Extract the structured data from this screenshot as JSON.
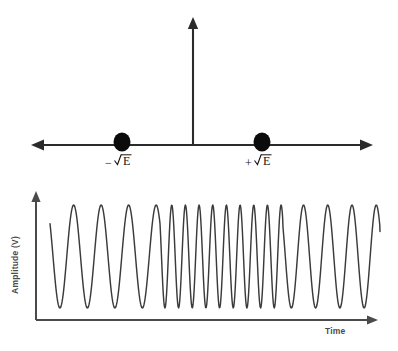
{
  "figure": {
    "title_visible": false,
    "background_color": "#ffffff",
    "stroke_color": "#3b3b3b",
    "axis_color": "#2b2b2b",
    "dot_color": "#0b0b0b"
  },
  "constellation": {
    "name": "bfsk-signal-space-diagram",
    "horizontal_axis": {
      "name": "horizontal-axis",
      "x_start": 32,
      "x_end": 372,
      "y": 145,
      "double_headed": true
    },
    "vertical_axis": {
      "name": "vertical-axis",
      "x": 193,
      "y_top": 18,
      "y_bottom": 145,
      "double_headed": false
    },
    "points": [
      {
        "name": "constellation-point-negative",
        "label_sign": "−",
        "label_radicand": "E",
        "label_text": "−√E",
        "cx": 122,
        "cy": 142,
        "rx": 8.5,
        "ry": 9.5,
        "label_x": 108,
        "label_y": 166
      },
      {
        "name": "constellation-point-positive",
        "label_sign": "+",
        "label_radicand": "E",
        "label_text": "+√E",
        "cx": 262,
        "cy": 142,
        "rx": 8.5,
        "ry": 9.5,
        "label_x": 248,
        "label_y": 166
      }
    ]
  },
  "chart_data": {
    "type": "line",
    "title": "",
    "xlabel": "Time",
    "ylabel": "Amplitude (V)",
    "grid": false,
    "legend": "none",
    "xlim": [
      0,
      1
    ],
    "ylim": [
      -1,
      1
    ],
    "segments": [
      {
        "name": "low-frequency-segment-1",
        "symbol": "0",
        "cycles": 4,
        "relative_frequency": 1.0,
        "x_start_px": 50,
        "x_end_px": 160
      },
      {
        "name": "high-frequency-segment",
        "symbol": "1",
        "cycles": 9,
        "relative_frequency": 2.0,
        "x_start_px": 160,
        "x_end_px": 283
      },
      {
        "name": "low-frequency-segment-2",
        "symbol": "0",
        "cycles": 4,
        "relative_frequency": 1.0,
        "x_start_px": 283,
        "x_end_px": 380
      }
    ],
    "amplitude_peak_px": 205,
    "amplitude_trough_px": 308,
    "baseline_px": 256.5,
    "trace_start_x_px": 50,
    "trace_end_x_px": 380
  },
  "waveform_axes": {
    "name": "waveform-axes",
    "y_axis": {
      "x": 36,
      "y_top": 192,
      "y_bottom": 320
    },
    "x_axis": {
      "y": 320,
      "x_start": 36,
      "x_end": 378
    },
    "ylabel_text": "Amplitude (V)",
    "ylabel_x": 18,
    "ylabel_y": 265,
    "xlabel_text": "Time",
    "xlabel_x": 325,
    "xlabel_y": 334
  }
}
